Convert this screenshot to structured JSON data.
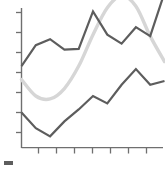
{
  "chart_data": {
    "type": "line",
    "title": "",
    "subtitle": "",
    "xlabel": "",
    "ylabel": "",
    "xlim": [
      0,
      10
    ],
    "ylim": [
      0,
      10
    ],
    "grid": false,
    "legend_position": "bottom-left",
    "background": "#ffffff",
    "axis_color": "#6f6f6f",
    "x_tick_count": 7,
    "y_tick_count": 7,
    "x_tick_labels": [
      "",
      "",
      "",
      "",
      "",
      "",
      ""
    ],
    "y_tick_labels": [
      "",
      "",
      "",
      "",
      "",
      "",
      ""
    ],
    "series": [
      {
        "name": "series-upper-dark",
        "color": "#5d5d5d",
        "style": "polyline",
        "width": 2.2,
        "x": [
          0.0,
          1.0,
          2.0,
          3.0,
          4.0,
          5.0,
          6.0,
          7.0,
          8.0,
          9.0,
          10.0
        ],
        "values": [
          5.45,
          6.85,
          7.25,
          6.55,
          6.6,
          9.1,
          7.55,
          6.95,
          8.05,
          7.45,
          10.35
        ]
      },
      {
        "name": "series-lower-dark",
        "color": "#5d5d5d",
        "style": "polyline",
        "width": 2.2,
        "x": [
          0.0,
          1.0,
          2.0,
          3.0,
          4.0,
          5.0,
          6.0,
          7.0,
          8.0,
          9.0,
          10.0
        ],
        "values": [
          2.35,
          1.3,
          0.75,
          1.75,
          2.55,
          3.45,
          2.95,
          4.2,
          5.25,
          4.2,
          4.45
        ]
      },
      {
        "name": "series-smooth-light",
        "color": "#d6d6d6",
        "style": "smooth",
        "width": 3.4,
        "x": [
          0.0,
          1.0,
          2.0,
          3.0,
          4.0,
          5.0,
          6.0,
          7.0,
          8.0,
          9.0,
          10.0
        ],
        "values": [
          4.55,
          3.45,
          3.25,
          3.95,
          5.45,
          7.55,
          9.35,
          10.15,
          9.45,
          7.45,
          5.75
        ]
      }
    ],
    "legend": [
      {
        "label": "",
        "color": "#5d5d5d",
        "marker": "bar"
      }
    ],
    "annotations": []
  },
  "footer": {
    "caption": ""
  }
}
